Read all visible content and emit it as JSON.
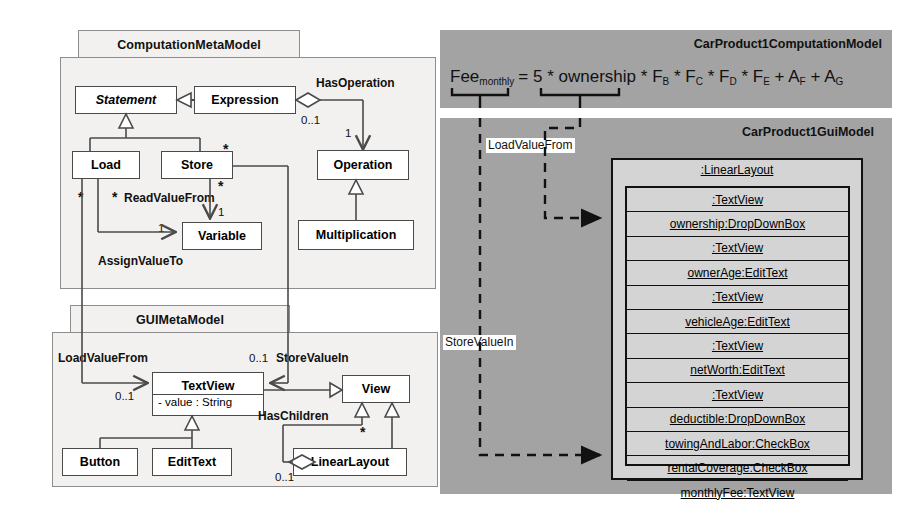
{
  "left": {
    "packages": [
      {
        "name": "ComputationMetaModel"
      },
      {
        "name": "GUIMetaModel"
      }
    ],
    "computation_classes": [
      {
        "id": "statement",
        "label": "Statement",
        "abstract": true
      },
      {
        "id": "expression",
        "label": "Expression",
        "abstract": false
      },
      {
        "id": "load",
        "label": "Load",
        "abstract": false
      },
      {
        "id": "store",
        "label": "Store",
        "abstract": false
      },
      {
        "id": "operation",
        "label": "Operation",
        "abstract": false
      },
      {
        "id": "variable",
        "label": "Variable",
        "abstract": false
      },
      {
        "id": "multiplication",
        "label": "Multiplication",
        "abstract": false
      }
    ],
    "gui_classes": [
      {
        "id": "textview",
        "label": "TextView",
        "attribute": "- value : String"
      },
      {
        "id": "view",
        "label": "View",
        "attribute": ""
      },
      {
        "id": "button",
        "label": "Button",
        "attribute": ""
      },
      {
        "id": "edittext",
        "label": "EditText",
        "attribute": ""
      },
      {
        "id": "linearlayout",
        "label": "LinearLayout",
        "attribute": ""
      }
    ],
    "association_labels": [
      {
        "id": "hasoperation",
        "text": "HasOperation"
      },
      {
        "id": "readvaluefrom",
        "text": "ReadValueFrom"
      },
      {
        "id": "assignvalueto",
        "text": "AssignValueTo"
      },
      {
        "id": "loadvaluefrom",
        "text": "LoadValueFrom"
      },
      {
        "id": "storevaluein",
        "text": "StoreValueIn"
      },
      {
        "id": "haschildren",
        "text": "HasChildren"
      }
    ],
    "multiplicities": [
      {
        "id": "hasoperation-src",
        "text": "0..1"
      },
      {
        "id": "hasoperation-tgt",
        "text": "1"
      },
      {
        "id": "readvaluefrom-tgt",
        "text": "1"
      },
      {
        "id": "assignvalueto-tgt",
        "text": "1"
      },
      {
        "id": "load-star",
        "text": "*"
      },
      {
        "id": "store-star-left",
        "text": "*"
      },
      {
        "id": "store-star-right",
        "text": "*"
      },
      {
        "id": "store-star-under",
        "text": "*"
      },
      {
        "id": "loadvaluefrom-src",
        "text": "0..1"
      },
      {
        "id": "storevaluein-src",
        "text": "0..1"
      },
      {
        "id": "haschildren-star",
        "text": "*"
      },
      {
        "id": "haschildren-src",
        "text": "0..1"
      }
    ]
  },
  "right": {
    "computation_model": {
      "title": "CarProduct1ComputationModel",
      "formula": {
        "lhs_base": "Fee",
        "lhs_sub": "monthly",
        "rhs": "= 5 * ownership * F B * F C * F D * F E + A F + A G",
        "terms": [
          {
            "base": "=",
            "sub": ""
          },
          {
            "base": "5",
            "sub": ""
          },
          {
            "base": "*",
            "sub": ""
          },
          {
            "base": "ownership",
            "sub": ""
          },
          {
            "base": "*",
            "sub": ""
          },
          {
            "base": "F",
            "sub": "B"
          },
          {
            "base": "*",
            "sub": ""
          },
          {
            "base": "F",
            "sub": "C"
          },
          {
            "base": "*",
            "sub": ""
          },
          {
            "base": "F",
            "sub": "D"
          },
          {
            "base": "*",
            "sub": ""
          },
          {
            "base": "F",
            "sub": "E"
          },
          {
            "base": "+",
            "sub": ""
          },
          {
            "base": "A",
            "sub": "F"
          },
          {
            "base": "+",
            "sub": ""
          },
          {
            "base": "A",
            "sub": "G"
          }
        ]
      }
    },
    "gui_model": {
      "title": "CarProduct1GuiModel",
      "root_object": ":LinearLayout",
      "children": [
        ":TextView",
        "ownership:DropDownBox",
        ":TextView",
        "ownerAge:EditText",
        ":TextView",
        "vehicleAge:EditText",
        ":TextView",
        "netWorth:EditText",
        ":TextView",
        "deductible:DropDownBox",
        "towingAndLabor:CheckBox",
        "rentalCoverage:CheckBox",
        "monthlyFee:TextView"
      ]
    },
    "trace_labels": [
      {
        "id": "loadvaluefrom",
        "text": "LoadValueFrom"
      },
      {
        "id": "storevaluein",
        "text": "StoreValueIn"
      }
    ]
  },
  "colors": {
    "panel_gray": "#a3a3a3",
    "package_bg": "#f2f1ef",
    "class_bg": "#ffffff",
    "object_bg": "#d4d4d4",
    "line": "#4a4a4a",
    "line_dark": "#111111"
  }
}
